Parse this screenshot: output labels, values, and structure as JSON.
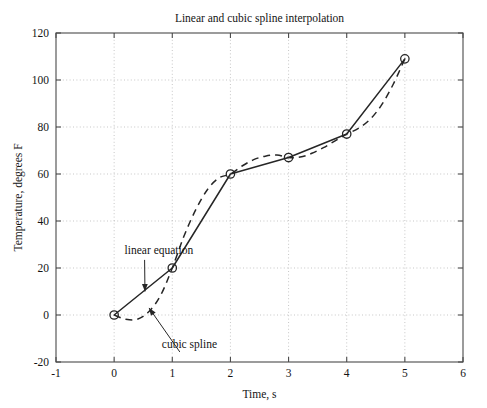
{
  "chart_data": {
    "type": "line",
    "title": "Linear and cubic spline interpolation",
    "xlabel": "Time, s",
    "ylabel": "Temperature, degrees F",
    "xlim": [
      -1,
      6
    ],
    "ylim": [
      -20,
      120
    ],
    "xticks": [
      "-1",
      "0",
      "1",
      "2",
      "3",
      "4",
      "5",
      "6"
    ],
    "xtick_values": [
      -1,
      0,
      1,
      2,
      3,
      4,
      5,
      6
    ],
    "yticks": [
      "-20",
      "0",
      "20",
      "40",
      "60",
      "80",
      "100",
      "120"
    ],
    "ytick_values": [
      -20,
      0,
      20,
      40,
      60,
      80,
      100,
      120
    ],
    "grid": true,
    "grid_style": "dotted",
    "legend": "none",
    "x": [
      0,
      1,
      2,
      3,
      4,
      5
    ],
    "series": [
      {
        "name": "linear equation",
        "style": "solid",
        "marker": "circle",
        "values": [
          0,
          20,
          60,
          67,
          77,
          109
        ]
      },
      {
        "name": "cubic spline",
        "style": "dashed",
        "marker": "none",
        "values": [
          0,
          20,
          60,
          67,
          77,
          109
        ],
        "dense_x": [
          0,
          0.2,
          0.4,
          0.6,
          0.8,
          1,
          1.2,
          1.4,
          1.6,
          1.8,
          2,
          2.2,
          2.4,
          2.6,
          2.8,
          3,
          3.2,
          3.4,
          3.6,
          3.8,
          4,
          4.2,
          4.4,
          4.6,
          4.8,
          5
        ],
        "dense_y": [
          0,
          -1.8,
          -1.8,
          1.5,
          8.4,
          20,
          33.5,
          44.6,
          53.2,
          58.3,
          60,
          63.4,
          66.1,
          67.6,
          68.1,
          67,
          67.2,
          68.8,
          71.2,
          74.1,
          77,
          79.4,
          83.2,
          89.4,
          98.2,
          109
        ]
      }
    ],
    "annotations": [
      {
        "id": "linear-equation",
        "text": "linear equation",
        "label_x": 0.18,
        "label_y": 26,
        "target_x": 0.53,
        "target_y": 10
      },
      {
        "id": "cubic-spline",
        "text": "cubic spline",
        "label_x": 0.82,
        "label_y": -14,
        "target_x": 0.6,
        "target_y": 3
      }
    ],
    "markers": [
      {
        "x": 0,
        "y": 0
      },
      {
        "x": 1,
        "y": 20
      },
      {
        "x": 2,
        "y": 60
      },
      {
        "x": 3,
        "y": 67
      },
      {
        "x": 4,
        "y": 77
      },
      {
        "x": 5,
        "y": 109
      }
    ],
    "colors": {
      "line": "#262626",
      "grid": "#b9b9b9",
      "axis": "#4a4a4a",
      "background": "#ffffff",
      "text": "#141414"
    }
  }
}
